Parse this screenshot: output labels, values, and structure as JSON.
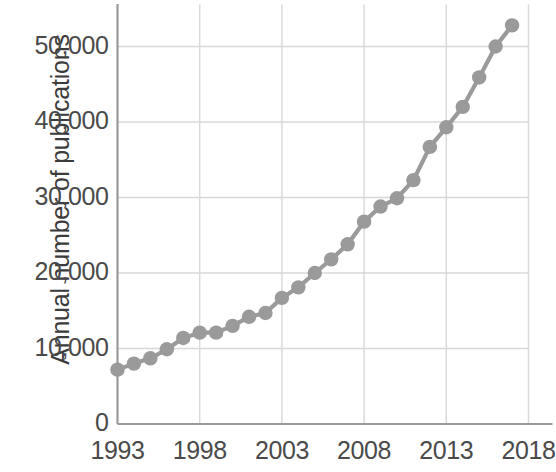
{
  "chart_data": {
    "type": "line",
    "title": "",
    "subtitle": "",
    "xlabel": "",
    "ylabel": "Annual number of publications",
    "xlim": [
      1993,
      2018
    ],
    "ylim": [
      0,
      53500
    ],
    "grid": true,
    "legend": null,
    "x_ticks": [
      "1993",
      "1998",
      "2003",
      "2008",
      "2013",
      "2018"
    ],
    "x_tick_values": [
      1993,
      1998,
      2003,
      2008,
      2013,
      2018
    ],
    "y_ticks": [
      "0",
      "10,000",
      "20,000",
      "30,000",
      "40,000",
      "50,000"
    ],
    "y_tick_values": [
      0,
      10000,
      20000,
      30000,
      40000,
      50000
    ],
    "marker": "circle",
    "marker_color": "#9a9a9a",
    "line_color": "#9a9a9a",
    "x": [
      1993,
      1994,
      1995,
      1996,
      1997,
      1998,
      1999,
      2000,
      2001,
      2002,
      2003,
      2004,
      2005,
      2006,
      2007,
      2008,
      2009,
      2010,
      2011,
      2012,
      2013,
      2014,
      2015,
      2016,
      2017
    ],
    "values": [
      7200,
      8000,
      8700,
      9900,
      11400,
      12100,
      12100,
      13000,
      14200,
      14700,
      16700,
      18100,
      20000,
      21800,
      23800,
      26800,
      28800,
      29900,
      32300,
      36700,
      39300,
      42000,
      45900,
      50000,
      52800
    ],
    "series": [
      {
        "name": "Annual number of publications",
        "values": [
          7200,
          8000,
          8700,
          9900,
          11400,
          12100,
          12100,
          13000,
          14200,
          14700,
          16700,
          18100,
          20000,
          21800,
          23800,
          26800,
          28800,
          29900,
          32300,
          36700,
          39300,
          42000,
          45900,
          50000,
          52800
        ]
      }
    ]
  },
  "axis": {
    "y_title": "Annual number of publications"
  },
  "colors": {
    "series": "#9a9a9a",
    "grid": "#d8d8d8",
    "axis": "#9a9a9a",
    "text": "#4a4a4a"
  }
}
